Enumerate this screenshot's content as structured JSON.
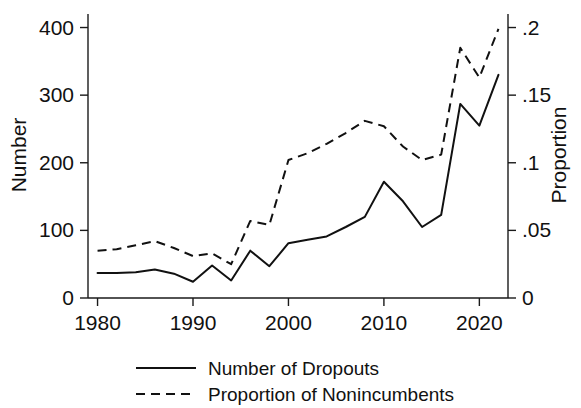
{
  "chart_data": {
    "type": "line",
    "title": "",
    "subtitle": "",
    "xlabel": "",
    "ylabel": "Number",
    "y2label": "Proportion",
    "xlim": [
      1979,
      2023
    ],
    "ylim": [
      0,
      420
    ],
    "y2lim": [
      0,
      0.21
    ],
    "grid": false,
    "legend_position": "bottom",
    "x_ticks": [
      1980,
      1990,
      2000,
      2010,
      2020
    ],
    "x_tick_labels": [
      "1980",
      "1990",
      "2000",
      "2010",
      "2020"
    ],
    "y_ticks": [
      0,
      100,
      200,
      300,
      400
    ],
    "y_tick_labels": [
      "0",
      "100",
      "200",
      "300",
      "400"
    ],
    "y2_ticks": [
      0,
      0.05,
      0.1,
      0.15,
      0.2
    ],
    "y2_tick_labels": [
      "0",
      ".05",
      ".1",
      ".15",
      ".2"
    ],
    "x": [
      1980,
      1982,
      1984,
      1986,
      1988,
      1990,
      1992,
      1994,
      1996,
      1998,
      2000,
      2002,
      2004,
      2006,
      2008,
      2010,
      2012,
      2014,
      2016,
      2018,
      2020,
      2022
    ],
    "series": [
      {
        "name": "Number of Dropouts",
        "axis": "left",
        "style": "solid",
        "color": "#111111",
        "values": [
          37,
          37,
          38,
          42,
          36,
          24,
          48,
          26,
          70,
          47,
          81,
          86,
          91,
          105,
          120,
          172,
          143,
          105,
          123,
          287,
          255,
          330
        ]
      },
      {
        "name": "Proportion of Nonincumbents",
        "axis": "right",
        "style": "dashed",
        "color": "#111111",
        "values": [
          0.035,
          0.036,
          0.039,
          0.042,
          0.037,
          0.031,
          0.033,
          0.025,
          0.057,
          0.054,
          0.102,
          0.107,
          0.114,
          0.122,
          0.131,
          0.127,
          0.112,
          0.102,
          0.106,
          0.185,
          0.163,
          0.199
        ]
      }
    ],
    "legend": [
      {
        "label": "Number of Dropouts",
        "style": "solid"
      },
      {
        "label": "Proportion of Nonincumbents",
        "style": "dashed"
      }
    ]
  }
}
